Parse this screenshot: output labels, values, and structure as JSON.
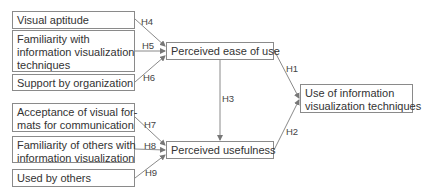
{
  "diagram": {
    "left_factors": [
      {
        "id": "visual-aptitude",
        "label": "Visual aptitude",
        "hypothesis": "H4",
        "target": "Perceived ease of use"
      },
      {
        "id": "familiarity",
        "label": "Familiarity with information visualization techniques",
        "lines": [
          "Familiarity with",
          "information visualization",
          "techniques"
        ],
        "hypothesis": "H5",
        "target": "Perceived ease of use"
      },
      {
        "id": "support",
        "label": "Support by organization",
        "hypothesis": "H6",
        "target": "Perceived ease of use"
      },
      {
        "id": "acceptance",
        "label": "Acceptance of visual formats for communication",
        "lines": [
          "Acceptance of visual for-",
          "mats for communication"
        ],
        "hypothesis": "H7",
        "target": "Perceived usefulness"
      },
      {
        "id": "familiarity-others",
        "label": "Familiarity of others with information visualization",
        "lines": [
          "Familiarity of others with",
          "information visualization"
        ],
        "hypothesis": "H8",
        "target": "Perceived usefulness"
      },
      {
        "id": "used-by-others",
        "label": "Used by others",
        "hypothesis": "H9",
        "target": "Perceived usefulness"
      }
    ],
    "middle": {
      "ease": {
        "label": "Perceived ease of use"
      },
      "usefulness": {
        "label": "Perceived usefulness"
      },
      "ease_to_usefulness": "H3"
    },
    "outcome": {
      "lines": [
        "Use of information",
        "visualization techniques"
      ],
      "label": "Use of information visualization techniques"
    },
    "edges_to_outcome": {
      "ease": "H1",
      "usefulness": "H2"
    },
    "colors": {
      "line": "#8a8a8a",
      "text": "#333333"
    }
  }
}
